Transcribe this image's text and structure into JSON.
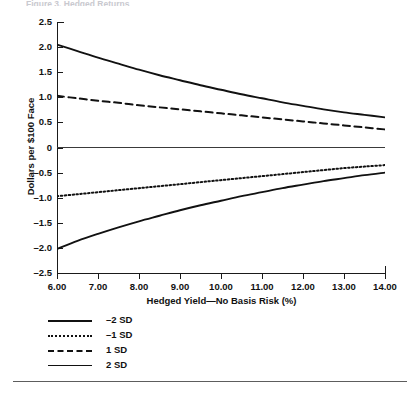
{
  "caption_sliver": "Figure 3. Hedged Returns",
  "chart_data": {
    "type": "line",
    "title": "",
    "xlabel": "Hedged Yield—No Basis Risk (%)",
    "ylabel": "Dollars per $100 Face",
    "xlim": [
      6.0,
      14.0
    ],
    "ylim": [
      -2.5,
      2.5
    ],
    "grid": false,
    "zero_line": true,
    "legend_position": "below-left",
    "x_ticks": [
      "6.00",
      "7.00",
      "8.00",
      "9.00",
      "10.00",
      "11.00",
      "12.00",
      "13.00",
      "14.00"
    ],
    "x_tick_values": [
      6.0,
      7.0,
      8.0,
      9.0,
      10.0,
      11.0,
      12.0,
      13.0,
      14.0
    ],
    "y_ticks": [
      "2.5",
      "2.0",
      "1.5",
      "1.0",
      "0.5",
      "0",
      "-0.5",
      "-1.0",
      "-1.5",
      "-2.0",
      "-2.5"
    ],
    "y_tick_values": [
      2.5,
      2.0,
      1.5,
      1.0,
      0.5,
      0,
      -0.5,
      -1.0,
      -1.5,
      -2.0,
      -2.5
    ],
    "x": [
      6.0,
      6.5,
      7.0,
      7.5,
      8.0,
      8.5,
      9.0,
      9.5,
      10.0,
      10.5,
      11.0,
      11.5,
      12.0,
      12.5,
      13.0,
      13.5,
      14.0
    ],
    "series": [
      {
        "name": "-2 SD",
        "style": "solid",
        "width": 1.9,
        "color": "#111111",
        "values": [
          2.05,
          1.92,
          1.79,
          1.67,
          1.55,
          1.44,
          1.34,
          1.24,
          1.15,
          1.06,
          0.98,
          0.9,
          0.83,
          0.76,
          0.7,
          0.65,
          0.6
        ]
      },
      {
        "name": "-1 SD",
        "style": "dotted",
        "width": 2.0,
        "color": "#111111",
        "values": [
          -0.97,
          -0.93,
          -0.89,
          -0.85,
          -0.81,
          -0.77,
          -0.73,
          -0.69,
          -0.65,
          -0.61,
          -0.57,
          -0.53,
          -0.49,
          -0.45,
          -0.41,
          -0.38,
          -0.35
        ]
      },
      {
        "name": "1 SD",
        "style": "dashed",
        "width": 2.0,
        "color": "#111111",
        "values": [
          1.03,
          0.98,
          0.93,
          0.89,
          0.84,
          0.8,
          0.76,
          0.72,
          0.68,
          0.64,
          0.6,
          0.56,
          0.52,
          0.48,
          0.44,
          0.4,
          0.36
        ]
      },
      {
        "name": "2 SD",
        "style": "solid",
        "width": 1.9,
        "color": "#111111",
        "values": [
          -2.02,
          -1.86,
          -1.72,
          -1.59,
          -1.47,
          -1.36,
          -1.25,
          -1.15,
          -1.06,
          -0.97,
          -0.89,
          -0.81,
          -0.74,
          -0.67,
          -0.61,
          -0.55,
          -0.5
        ]
      }
    ]
  },
  "legend": {
    "items": [
      {
        "label": "-2 SD",
        "style": "solid-thick"
      },
      {
        "label": "-1 SD",
        "style": "dotted"
      },
      {
        "label": "1 SD",
        "style": "dashed"
      },
      {
        "label": "2 SD",
        "style": "solid-thin"
      }
    ]
  },
  "colors": {
    "ink": "#111111",
    "rule": "#5d5d5d",
    "background": "#ffffff"
  }
}
